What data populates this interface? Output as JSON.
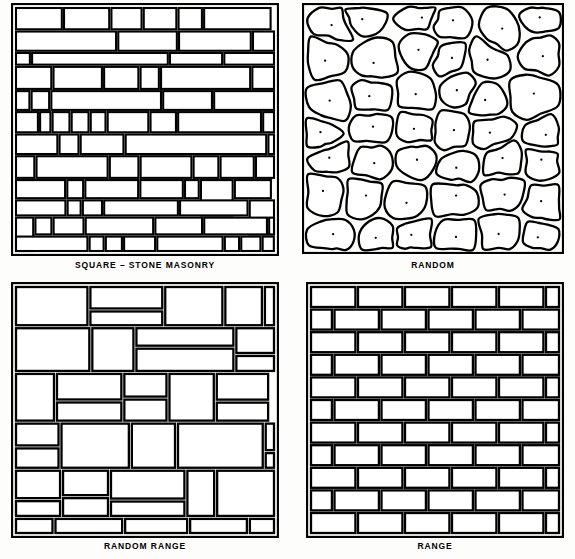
{
  "figure": {
    "background_color": "#fdfdfb",
    "ink_color": "#000000",
    "stone_fill": "#ffffff"
  },
  "panels": [
    {
      "id": "square-stone-masonry",
      "caption": "SQUARE – STONE MASONRY",
      "pattern": "ashlar-broken-course",
      "description": "Rectangular squared stones of many sizes laid in broken courses"
    },
    {
      "id": "random",
      "caption": "RANDOM",
      "pattern": "rubble",
      "description": "Irregular rounded rubble stones with center pecking dots"
    },
    {
      "id": "random-range",
      "caption": "RANDOM RANGE",
      "pattern": "random-range-ashlar",
      "description": "Large squared stones in irregular ranges"
    },
    {
      "id": "range",
      "caption": "RANGE",
      "pattern": "running-bond",
      "description": "Uniform coursed stones in running bond"
    }
  ]
}
